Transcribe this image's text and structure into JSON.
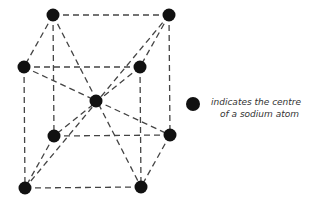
{
  "diagram": {
    "atoms": [
      {
        "id": "top-back-left",
        "x": 53,
        "y": 15
      },
      {
        "id": "top-back-right",
        "x": 169,
        "y": 15
      },
      {
        "id": "top-front-left",
        "x": 24,
        "y": 67
      },
      {
        "id": "top-front-right",
        "x": 140,
        "y": 67
      },
      {
        "id": "centre",
        "x": 96,
        "y": 101
      },
      {
        "id": "bottom-back-left",
        "x": 54,
        "y": 136
      },
      {
        "id": "bottom-back-right",
        "x": 170,
        "y": 135
      },
      {
        "id": "bottom-front-left",
        "x": 25,
        "y": 188
      },
      {
        "id": "bottom-front-right",
        "x": 141,
        "y": 187
      }
    ],
    "edges": [
      [
        "top-back-left",
        "top-back-right"
      ],
      [
        "top-back-left",
        "top-front-left"
      ],
      [
        "top-back-right",
        "top-front-right"
      ],
      [
        "top-front-left",
        "top-front-right"
      ],
      [
        "top-back-left",
        "bottom-back-left"
      ],
      [
        "top-back-right",
        "bottom-back-right"
      ],
      [
        "top-front-left",
        "bottom-front-left"
      ],
      [
        "top-front-right",
        "bottom-front-right"
      ],
      [
        "bottom-back-left",
        "bottom-back-right"
      ],
      [
        "bottom-back-left",
        "bottom-front-left"
      ],
      [
        "bottom-back-right",
        "bottom-front-right"
      ],
      [
        "bottom-front-left",
        "bottom-front-right"
      ],
      [
        "top-back-left",
        "bottom-front-right"
      ],
      [
        "top-back-right",
        "bottom-front-left"
      ],
      [
        "top-front-left",
        "bottom-back-right"
      ],
      [
        "top-front-right",
        "bottom-back-left"
      ]
    ],
    "atom_color": "#111111",
    "line_color": "#444444"
  },
  "legend": {
    "line1": "indicates the centre",
    "line2": "of a sodium atom"
  }
}
